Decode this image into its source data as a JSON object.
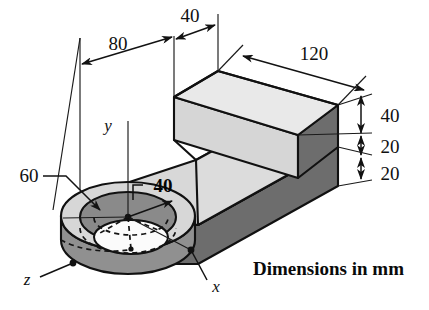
{
  "figure": {
    "caption": "Dimensions in mm",
    "units": "mm"
  },
  "axes": {
    "y_label": "y",
    "x_label": "x",
    "z_label": "z"
  },
  "dimensions": [
    {
      "id": "len-80",
      "value": "80",
      "meaning": "distance from boss center line to step face"
    },
    {
      "id": "len-40-top",
      "value": "40",
      "meaning": "depth of raised block along top edge"
    },
    {
      "id": "len-120",
      "value": "120",
      "meaning": "length of raised block along x"
    },
    {
      "id": "ht-40",
      "value": "40",
      "meaning": "height of raised block above slab"
    },
    {
      "id": "ht-20-a",
      "value": "20",
      "meaning": "upper slab thickness"
    },
    {
      "id": "ht-20-b",
      "value": "20",
      "meaning": "lower slab thickness"
    },
    {
      "id": "dia-60",
      "value": "60",
      "meaning": "boss outer diameter callout"
    },
    {
      "id": "dia-40",
      "value": "40",
      "meaning": "hole diameter callout at center"
    }
  ],
  "colors": {
    "top_face_light": "#e9e9e9",
    "side_face_mid": "#d2d2d2",
    "side_face_dark": "#6d6d6d",
    "boss_ring_dark": "#8a8a8a",
    "boss_wall": "#909090",
    "hole_white": "#fbfbfb",
    "outline": "#111111",
    "background": "#ffffff"
  }
}
